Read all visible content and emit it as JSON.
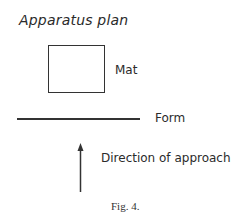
{
  "diagram": {
    "title": "Apparatus plan",
    "elements": {
      "mat": {
        "label": "Mat",
        "shape": "rectangle"
      },
      "form": {
        "label": "Form",
        "shape": "horizontal-line"
      },
      "approach": {
        "label": "Direction of approach",
        "shape": "up-arrow"
      }
    },
    "caption": "Fig. 4."
  },
  "colors": {
    "stroke": "#333333",
    "text": "#2b2b2b",
    "background": "#ffffff"
  }
}
